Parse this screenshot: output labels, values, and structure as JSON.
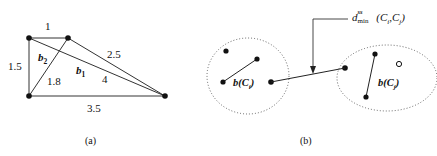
{
  "figure": {
    "panels": [
      {
        "id": "a",
        "caption": "(a)",
        "type": "weighted-graph",
        "nodes": [
          {
            "name": "node-top-left",
            "x": 29,
            "y": 38
          },
          {
            "name": "node-top-right",
            "x": 68,
            "y": 38
          },
          {
            "name": "node-bottom-left",
            "x": 29,
            "y": 96
          },
          {
            "name": "node-right",
            "x": 165,
            "y": 96
          }
        ],
        "edge_labels": {
          "top": "1",
          "left": "1.5",
          "diagonal": "1.8",
          "upper_right": "2.5",
          "middle_right": "4",
          "bottom": "3.5"
        },
        "bold_labels": {
          "b2": "b",
          "b2_sub": "2",
          "b1": "b",
          "b1_sub": "1"
        }
      },
      {
        "id": "b",
        "caption": "(b)",
        "type": "cluster-distance",
        "clusters": [
          {
            "name": "cluster-left",
            "label_base": "b",
            "label_args": "(C",
            "label_sub": "i",
            "label_close": ")",
            "label_text": "b(C_i)"
          },
          {
            "name": "cluster-right",
            "label_base": "b",
            "label_args": "(C",
            "label_sub": "j",
            "label_close": ")",
            "label_text": "b(C_j)"
          }
        ],
        "distance_label": {
          "symbol": "d",
          "superscript": "ss",
          "subscript": "min",
          "arguments_open": "(C",
          "arg1_sub": "i",
          "arguments_comma": ",C",
          "arg2_sub": "j",
          "arguments_close": ")",
          "full_text": "d^ss_min (Ci,Cj)"
        }
      }
    ],
    "colors": {
      "ink": "#111111",
      "line": "#333333",
      "dotted": "#555555",
      "background": "#ffffff"
    }
  }
}
